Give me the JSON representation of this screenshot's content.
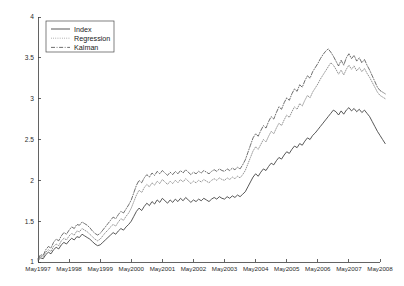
{
  "figure": {
    "background_color": "#ffffff",
    "plot_left": 38,
    "plot_right": 380,
    "plot_top": 17,
    "plot_bottom": 262
  },
  "legend": {
    "position": "top-left",
    "box": {
      "x": 46,
      "y": 21,
      "width": 68,
      "height": 31
    },
    "entries": [
      {
        "label": "Index",
        "style": "solid",
        "color": "#3a3a3a"
      },
      {
        "label": "Regression",
        "style": "dotted",
        "color": "#8c8c8c"
      },
      {
        "label": "Kalman",
        "style": "dashdot",
        "color": "#555555"
      }
    ]
  },
  "chart_data": {
    "type": "line",
    "title": "",
    "xlabel": "",
    "ylabel": "",
    "ylim": [
      1,
      4
    ],
    "xlim": [
      0,
      11
    ],
    "grid": false,
    "legend_position": "top-left",
    "ytick_labels": [
      "1",
      "1.5",
      "2",
      "2.5",
      "3",
      "3.5",
      "4"
    ],
    "ytick_values": [
      1,
      1.5,
      2,
      2.5,
      3,
      3.5,
      4
    ],
    "xtick_labels": [
      "May1997",
      "May1998",
      "May1999",
      "May2000",
      "May2001",
      "May2002",
      "May2003",
      "May2004",
      "May2005",
      "May2006",
      "May2007",
      "May2008"
    ],
    "xtick_values": [
      0,
      1,
      2,
      3,
      4,
      5,
      6,
      7,
      8,
      9,
      10,
      11
    ],
    "x": [
      0,
      0.0833,
      0.1667,
      0.25,
      0.3333,
      0.4167,
      0.5,
      0.5833,
      0.6667,
      0.75,
      0.8333,
      0.9167,
      1,
      1.0833,
      1.1667,
      1.25,
      1.3333,
      1.4167,
      1.5,
      1.5833,
      1.6667,
      1.75,
      1.8333,
      1.9167,
      2,
      2.0833,
      2.1667,
      2.25,
      2.3333,
      2.4167,
      2.5,
      2.5833,
      2.6667,
      2.75,
      2.8333,
      2.9167,
      3,
      3.0833,
      3.1667,
      3.25,
      3.3333,
      3.4167,
      3.5,
      3.5833,
      3.6667,
      3.75,
      3.8333,
      3.9167,
      4,
      4.0833,
      4.1667,
      4.25,
      4.3333,
      4.4167,
      4.5,
      4.5833,
      4.6667,
      4.75,
      4.8333,
      4.9167,
      5,
      5.0833,
      5.1667,
      5.25,
      5.3333,
      5.4167,
      5.5,
      5.5833,
      5.6667,
      5.75,
      5.8333,
      5.9167,
      6,
      6.0833,
      6.1667,
      6.25,
      6.3333,
      6.4167,
      6.5,
      6.5833,
      6.6667,
      6.75,
      6.8333,
      6.9167,
      7,
      7.0833,
      7.1667,
      7.25,
      7.3333,
      7.4167,
      7.5,
      7.5833,
      7.6667,
      7.75,
      7.8333,
      7.9167,
      8,
      8.0833,
      8.1667,
      8.25,
      8.3333,
      8.4167,
      8.5,
      8.5833,
      8.6667,
      8.75,
      8.8333,
      8.9167,
      9,
      9.0833,
      9.1667,
      9.25,
      9.3333,
      9.4167,
      9.5,
      9.5833,
      9.6667,
      9.75,
      9.8333,
      9.9167,
      10,
      10.0833,
      10.1667,
      10.25,
      10.3333,
      10.4167,
      10.5,
      10.5833,
      10.6667,
      10.75,
      10.8333,
      10.9167,
      11,
      11.0833,
      11.1667
    ],
    "series": [
      {
        "name": "Index",
        "style": "solid",
        "color": "#3a3a3a",
        "values": [
          1.02,
          1.05,
          1.04,
          1.09,
          1.12,
          1.1,
          1.15,
          1.18,
          1.16,
          1.21,
          1.24,
          1.22,
          1.26,
          1.29,
          1.27,
          1.31,
          1.3,
          1.34,
          1.32,
          1.3,
          1.28,
          1.25,
          1.22,
          1.2,
          1.21,
          1.24,
          1.27,
          1.3,
          1.33,
          1.36,
          1.34,
          1.38,
          1.41,
          1.39,
          1.43,
          1.46,
          1.5,
          1.56,
          1.62,
          1.66,
          1.63,
          1.68,
          1.72,
          1.69,
          1.74,
          1.71,
          1.76,
          1.73,
          1.78,
          1.75,
          1.72,
          1.76,
          1.73,
          1.77,
          1.74,
          1.78,
          1.75,
          1.79,
          1.76,
          1.73,
          1.76,
          1.74,
          1.77,
          1.75,
          1.78,
          1.76,
          1.74,
          1.77,
          1.79,
          1.77,
          1.8,
          1.78,
          1.77,
          1.8,
          1.78,
          1.81,
          1.79,
          1.82,
          1.8,
          1.83,
          1.86,
          1.92,
          1.98,
          2.04,
          2.08,
          2.05,
          2.1,
          2.14,
          2.12,
          2.17,
          2.21,
          2.19,
          2.24,
          2.28,
          2.26,
          2.31,
          2.35,
          2.33,
          2.38,
          2.42,
          2.4,
          2.45,
          2.43,
          2.48,
          2.52,
          2.5,
          2.55,
          2.58,
          2.62,
          2.66,
          2.7,
          2.74,
          2.78,
          2.82,
          2.86,
          2.84,
          2.8,
          2.85,
          2.81,
          2.86,
          2.89,
          2.85,
          2.88,
          2.84,
          2.87,
          2.83,
          2.86,
          2.82,
          2.78,
          2.72,
          2.66,
          2.6,
          2.55,
          2.5,
          2.45
        ]
      },
      {
        "name": "Regression",
        "style": "dotted",
        "color": "#8c8c8c",
        "values": [
          1.03,
          1.07,
          1.06,
          1.12,
          1.15,
          1.13,
          1.19,
          1.22,
          1.2,
          1.26,
          1.29,
          1.27,
          1.32,
          1.35,
          1.33,
          1.38,
          1.37,
          1.41,
          1.39,
          1.37,
          1.34,
          1.31,
          1.28,
          1.26,
          1.28,
          1.32,
          1.36,
          1.39,
          1.43,
          1.46,
          1.44,
          1.49,
          1.53,
          1.51,
          1.56,
          1.6,
          1.66,
          1.74,
          1.82,
          1.88,
          1.85,
          1.91,
          1.95,
          1.92,
          1.97,
          1.94,
          1.99,
          1.96,
          2.01,
          1.98,
          1.95,
          1.99,
          1.96,
          2.0,
          1.97,
          2.01,
          1.98,
          2.02,
          1.99,
          1.96,
          1.99,
          1.97,
          2.0,
          1.98,
          2.01,
          1.99,
          1.97,
          2.0,
          2.02,
          2.0,
          2.03,
          2.01,
          2.0,
          2.03,
          2.01,
          2.04,
          2.02,
          2.05,
          2.03,
          2.07,
          2.12,
          2.2,
          2.28,
          2.36,
          2.41,
          2.38,
          2.44,
          2.5,
          2.47,
          2.54,
          2.6,
          2.57,
          2.64,
          2.7,
          2.67,
          2.74,
          2.8,
          2.77,
          2.84,
          2.9,
          2.87,
          2.94,
          2.91,
          2.98,
          3.04,
          3.01,
          3.08,
          3.13,
          3.18,
          3.24,
          3.29,
          3.34,
          3.39,
          3.44,
          3.41,
          3.36,
          3.3,
          3.35,
          3.29,
          3.36,
          3.41,
          3.36,
          3.4,
          3.34,
          3.38,
          3.33,
          3.37,
          3.31,
          3.26,
          3.2,
          3.14,
          3.08,
          3.04,
          3.02,
          3.0
        ]
      },
      {
        "name": "Kalman",
        "style": "dashdot",
        "color": "#555555",
        "values": [
          1.04,
          1.09,
          1.08,
          1.15,
          1.19,
          1.17,
          1.24,
          1.28,
          1.26,
          1.32,
          1.36,
          1.34,
          1.39,
          1.43,
          1.41,
          1.46,
          1.45,
          1.49,
          1.47,
          1.45,
          1.42,
          1.38,
          1.35,
          1.33,
          1.35,
          1.39,
          1.43,
          1.47,
          1.51,
          1.55,
          1.53,
          1.58,
          1.62,
          1.6,
          1.65,
          1.7,
          1.76,
          1.85,
          1.94,
          2.0,
          1.97,
          2.03,
          2.07,
          2.04,
          2.09,
          2.06,
          2.11,
          2.08,
          2.12,
          2.09,
          2.06,
          2.1,
          2.07,
          2.11,
          2.08,
          2.12,
          2.09,
          2.13,
          2.1,
          2.07,
          2.1,
          2.08,
          2.11,
          2.09,
          2.12,
          2.1,
          2.08,
          2.11,
          2.13,
          2.11,
          2.14,
          2.12,
          2.11,
          2.14,
          2.12,
          2.15,
          2.13,
          2.16,
          2.14,
          2.19,
          2.25,
          2.34,
          2.43,
          2.52,
          2.57,
          2.54,
          2.61,
          2.67,
          2.64,
          2.72,
          2.78,
          2.75,
          2.83,
          2.9,
          2.87,
          2.95,
          3.01,
          2.98,
          3.06,
          3.12,
          3.09,
          3.17,
          3.14,
          3.22,
          3.28,
          3.25,
          3.33,
          3.38,
          3.43,
          3.49,
          3.54,
          3.58,
          3.61,
          3.57,
          3.52,
          3.46,
          3.4,
          3.47,
          3.41,
          3.5,
          3.55,
          3.49,
          3.53,
          3.46,
          3.5,
          3.44,
          3.48,
          3.41,
          3.35,
          3.28,
          3.21,
          3.14,
          3.1,
          3.08,
          3.06
        ]
      }
    ]
  }
}
